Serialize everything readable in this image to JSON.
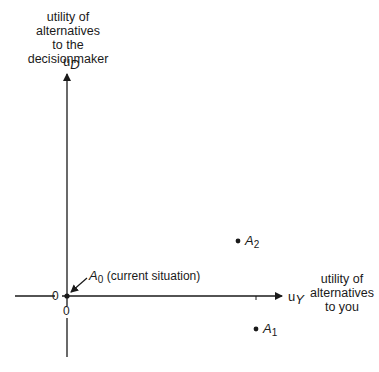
{
  "y_axis": {
    "title_lines": [
      "utility of",
      "alternatives",
      "to the",
      "decisionmaker"
    ],
    "symbol": "u",
    "symbol_sub": "D",
    "zero_label": "0"
  },
  "x_axis": {
    "title_lines": [
      "utility of",
      "alternatives",
      "to you"
    ],
    "symbol": "u",
    "symbol_sub": "Y",
    "zero_label": "0"
  },
  "points": [
    {
      "name": "A",
      "sub": "0",
      "note": "(current situation)"
    },
    {
      "name": "A",
      "sub": "1",
      "note": ""
    },
    {
      "name": "A",
      "sub": "2",
      "note": ""
    }
  ],
  "colors": {
    "ink": "#1a1a1a",
    "background": "#ffffff"
  }
}
